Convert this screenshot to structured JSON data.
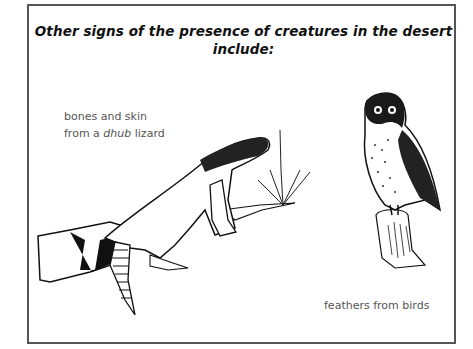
{
  "title": {
    "line1": "Other signs of the presence of creatures in the desert",
    "line2": "include:"
  },
  "captions": {
    "lizard": {
      "line1": "bones and skin",
      "line2_prefix": "from a ",
      "line2_italic": "dhub",
      "line2_suffix": " lizard"
    },
    "birds": "feathers from birds"
  },
  "illustrations": [
    {
      "name": "dhub-lizard",
      "description": "lizard on log with small plant"
    },
    {
      "name": "owl",
      "description": "owl perched on tree stump"
    }
  ],
  "colors": {
    "frame": "#555555",
    "title": "#111111",
    "caption": "#555555"
  }
}
